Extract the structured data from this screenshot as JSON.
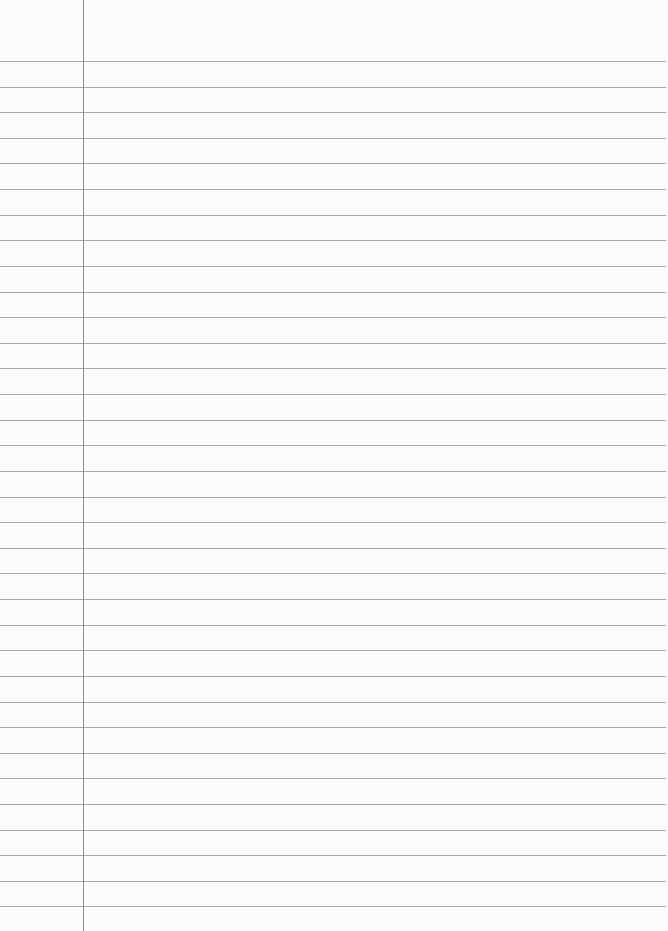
{
  "paper": {
    "type": "lined-notebook-page",
    "background_color": "#fbfbfb",
    "rule_color": "#a9a9a9",
    "margin_color": "#8e8e8e",
    "margin_x": 83,
    "first_rule_y": 61,
    "rule_spacing": 25.62,
    "rule_count": 34
  }
}
